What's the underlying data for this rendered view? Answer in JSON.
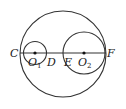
{
  "diagram": {
    "type": "geometry-circles",
    "stroke_color": "#333333",
    "background": "#ffffff",
    "big_circle": {
      "cx": 63,
      "cy": 54,
      "r": 43
    },
    "circle_o1": {
      "cx": 35,
      "cy": 53,
      "r": 11.5
    },
    "circle_o2": {
      "cx": 84,
      "cy": 53,
      "r": 21
    },
    "segment_cf": {
      "x1": 20,
      "y1": 53,
      "x2": 106,
      "y2": 53
    },
    "points": [
      {
        "name": "O1",
        "x": 35,
        "y": 53
      },
      {
        "name": "O2",
        "x": 84,
        "y": 53
      }
    ],
    "labels": {
      "C": "C",
      "D": "D",
      "E": "E",
      "F": "F",
      "O1_main": "O",
      "O1_sub": "1",
      "O2_main": "O",
      "O2_sub": "2"
    }
  }
}
